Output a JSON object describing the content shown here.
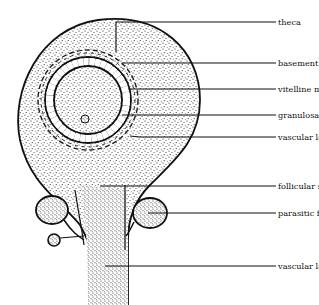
{
  "figure": {
    "labels": [
      {
        "id": "theca",
        "text": "theca",
        "x": 278,
        "y": 19
      },
      {
        "id": "basement-membrane",
        "text": "basement membrane",
        "x": 278,
        "y": 60
      },
      {
        "id": "vitelline-membrane",
        "text": "vitelline membrane",
        "x": 278,
        "y": 86
      },
      {
        "id": "granulosa",
        "text": "granulosa",
        "x": 278,
        "y": 112
      },
      {
        "id": "vascular-layer-follicle-wall",
        "text": "vascular layer of follicle wall",
        "x": 278,
        "y": 134
      },
      {
        "id": "follicular-stalk",
        "text": "follicular stalk",
        "x": 278,
        "y": 183
      },
      {
        "id": "parasitic-follicle",
        "text": "parasitic follicle",
        "x": 278,
        "y": 210
      },
      {
        "id": "vascular-layer-stalk",
        "text": "vascular layer of stalk",
        "x": 278,
        "y": 263
      }
    ]
  }
}
